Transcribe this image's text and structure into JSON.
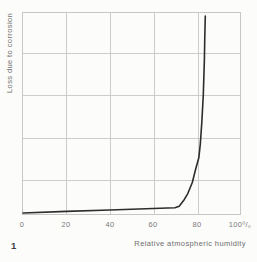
{
  "figure": {
    "number": "1"
  },
  "chart_data": {
    "type": "line",
    "title": "",
    "xlabel": "Relative atmospheric humidity",
    "ylabel": "Loss due to corrosion",
    "x_ticks": [
      "0",
      "20",
      "40",
      "60",
      "80",
      "100⁰/₀"
    ],
    "xlim": [
      0,
      100
    ],
    "ylim": [
      0,
      1
    ],
    "grid": true,
    "y_axis": "unlabeled relative scale (loss due to corrosion, 0 = none at bottom)",
    "legend": "none",
    "series": [
      {
        "name": "corrosion-loss-vs-humidity",
        "points": [
          [
            0,
            0.0
          ],
          [
            20,
            0.008
          ],
          [
            40,
            0.015
          ],
          [
            60,
            0.023
          ],
          [
            70,
            0.027
          ],
          [
            72,
            0.034
          ],
          [
            74,
            0.063
          ],
          [
            76,
            0.1
          ],
          [
            78,
            0.155
          ],
          [
            79.5,
            0.22
          ],
          [
            81,
            0.28
          ],
          [
            81.7,
            0.35
          ],
          [
            82.4,
            0.46
          ],
          [
            83.1,
            0.6
          ],
          [
            83.6,
            0.78
          ],
          [
            83.8,
            0.9
          ],
          [
            84,
            1.0
          ]
        ]
      }
    ]
  },
  "colors": {
    "background": "#fcfcfa",
    "grid": "#c9c9c7",
    "curve": "#2d2d2d",
    "tick_text": "#7a7a7a",
    "axis_label_text": "#6e6e6e",
    "figure_number_text": "#404040"
  }
}
